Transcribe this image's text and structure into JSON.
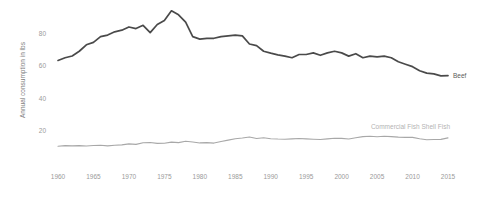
{
  "chart_data": {
    "type": "line",
    "title": "",
    "subtitle": "",
    "xlabel": "",
    "ylabel": "Annual consumption in lbs",
    "xlim": [
      1960,
      2015
    ],
    "ylim": [
      0,
      92
    ],
    "grid": false,
    "legend_position": "inline-right-of-line-ends",
    "xticks": [
      1960,
      1965,
      1970,
      1975,
      1980,
      1985,
      1990,
      1995,
      2000,
      2005,
      2010,
      2015
    ],
    "xtick_labels": [
      "1960",
      "1965",
      "1970",
      "1975",
      "1980",
      "1985",
      "1990",
      "1995",
      "2000",
      "2005",
      "2010",
      "2015"
    ],
    "yticks": [
      20,
      40,
      60,
      80
    ],
    "ytick_labels": [
      "20",
      "40",
      "60",
      "80"
    ],
    "x": [
      1960,
      1961,
      1962,
      1963,
      1964,
      1965,
      1966,
      1967,
      1968,
      1969,
      1970,
      1971,
      1972,
      1973,
      1974,
      1975,
      1976,
      1977,
      1978,
      1979,
      1980,
      1981,
      1982,
      1983,
      1984,
      1985,
      1986,
      1987,
      1988,
      1989,
      1990,
      1991,
      1992,
      1993,
      1994,
      1995,
      1996,
      1997,
      1998,
      1999,
      2000,
      2001,
      2002,
      2003,
      2004,
      2005,
      2006,
      2007,
      2008,
      2009,
      2010,
      2011,
      2012,
      2013,
      2014,
      2015
    ],
    "series": [
      {
        "name": "Beef",
        "color": "#4a4a4a",
        "label": "Beef",
        "values": [
          63.3,
          65.0,
          66.1,
          69.0,
          73.0,
          74.5,
          78.0,
          79.0,
          81.0,
          82.0,
          84.0,
          83.0,
          85.0,
          80.5,
          85.5,
          88.0,
          94.0,
          91.5,
          87.0,
          78.0,
          76.5,
          77.0,
          77.0,
          78.0,
          78.5,
          79.0,
          78.5,
          73.5,
          72.5,
          69.0,
          67.8,
          66.8,
          66.0,
          65.0,
          67.0,
          67.0,
          68.0,
          66.5,
          68.0,
          69.0,
          68.0,
          66.0,
          67.5,
          65.0,
          66.0,
          65.5,
          66.0,
          65.0,
          62.5,
          61.0,
          59.5,
          57.0,
          55.5,
          55.0,
          53.8,
          54.0
        ]
      },
      {
        "name": "Commercial Fish Shell Fish",
        "color": "#a8a8a8",
        "label": "Commercial Fish Shell Fish",
        "values": [
          10.3,
          10.7,
          10.6,
          10.7,
          10.5,
          10.8,
          11.0,
          10.6,
          11.0,
          11.2,
          11.8,
          11.5,
          12.5,
          12.7,
          12.1,
          12.2,
          12.9,
          12.6,
          13.4,
          13.0,
          12.4,
          12.6,
          12.3,
          13.3,
          14.1,
          15.0,
          15.4,
          16.1,
          15.1,
          15.6,
          15.0,
          14.8,
          14.7,
          14.9,
          15.1,
          14.9,
          14.7,
          14.5,
          14.9,
          15.3,
          15.2,
          14.8,
          15.6,
          16.3,
          16.5,
          16.2,
          16.5,
          16.3,
          16.0,
          15.8,
          15.8,
          15.0,
          14.4,
          14.5,
          14.6,
          15.5
        ]
      }
    ]
  },
  "axis": {
    "y_title": "Annual consumption in lbs"
  }
}
